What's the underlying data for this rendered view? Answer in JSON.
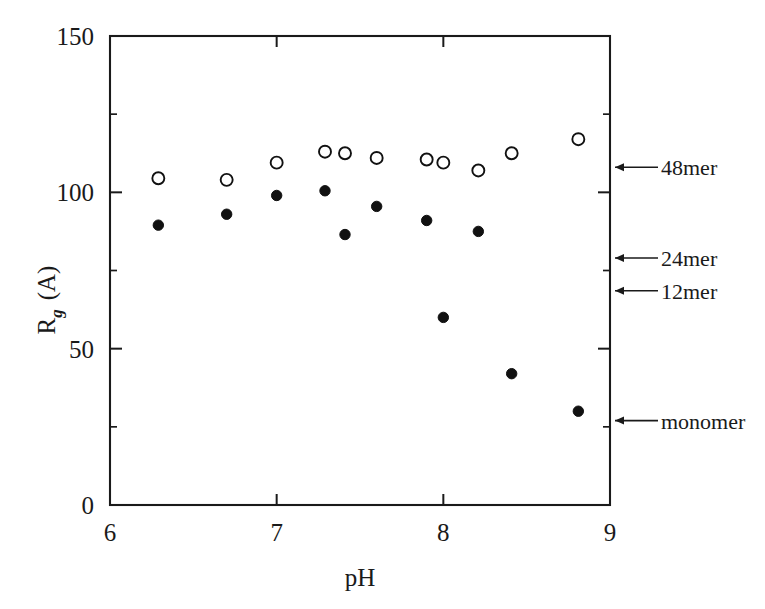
{
  "chart_data": {
    "type": "scatter",
    "title": "",
    "xlabel": "pH",
    "ylabel": "R_g (A)",
    "ylabel_main": "R",
    "ylabel_sub": "g",
    "ylabel_unit": "(A)",
    "xlim": [
      6,
      9
    ],
    "ylim": [
      0,
      150
    ],
    "xticks": [
      6,
      7,
      8,
      9
    ],
    "xtick_labels": [
      "6",
      "7",
      "8",
      "9"
    ],
    "yticks": [
      0,
      50,
      100,
      150
    ],
    "ytick_labels": [
      "0",
      "50",
      "100",
      "150"
    ],
    "y_minor_ticks": [
      25,
      75,
      125
    ],
    "grid": false,
    "legend": "none",
    "frame": "box",
    "series": [
      {
        "name": "open-circles",
        "marker": "open-circle",
        "color": "#111111",
        "points": [
          {
            "x": 6.29,
            "y": 104.5
          },
          {
            "x": 6.7,
            "y": 104.0
          },
          {
            "x": 7.0,
            "y": 109.5
          },
          {
            "x": 7.29,
            "y": 113.0
          },
          {
            "x": 7.41,
            "y": 112.5
          },
          {
            "x": 7.6,
            "y": 111.0
          },
          {
            "x": 7.9,
            "y": 110.5
          },
          {
            "x": 8.0,
            "y": 109.5
          },
          {
            "x": 8.21,
            "y": 107.0
          },
          {
            "x": 8.41,
            "y": 112.5
          },
          {
            "x": 8.81,
            "y": 117.0
          }
        ]
      },
      {
        "name": "filled-circles",
        "marker": "filled-circle",
        "color": "#111111",
        "points": [
          {
            "x": 6.29,
            "y": 89.5
          },
          {
            "x": 6.7,
            "y": 93.0
          },
          {
            "x": 7.0,
            "y": 99.0
          },
          {
            "x": 7.29,
            "y": 100.5
          },
          {
            "x": 7.41,
            "y": 86.5
          },
          {
            "x": 7.6,
            "y": 95.5
          },
          {
            "x": 7.9,
            "y": 91.0
          },
          {
            "x": 8.0,
            "y": 60.0
          },
          {
            "x": 8.21,
            "y": 87.5
          },
          {
            "x": 8.41,
            "y": 42.0
          },
          {
            "x": 8.81,
            "y": 30.0
          }
        ]
      }
    ],
    "annotations": [
      {
        "label": "48mer",
        "y": 108.0
      },
      {
        "label": "24mer",
        "y": 79.0
      },
      {
        "label": "12mer",
        "y": 68.5
      },
      {
        "label": "monomer",
        "y": 27.0
      }
    ]
  }
}
